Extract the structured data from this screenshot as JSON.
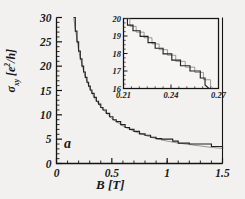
{
  "figure": {
    "panel_label": "a",
    "background_color": "#f2f1ef",
    "line_color": "#222222",
    "secondary_line_color": "#8a8a8a",
    "axis_color": "#141414"
  },
  "main_axes": {
    "xlabel": "B [T]",
    "ylabel_sigma": "σ",
    "ylabel_sub": "xy",
    "ylabel_units_open": " [e",
    "ylabel_sup": "2",
    "ylabel_units_close": "/h]",
    "xticks": [
      "0",
      "0.5",
      "1",
      "1.5"
    ],
    "xtick_values": [
      0,
      0.5,
      1,
      1.5
    ],
    "yticks": [
      "0",
      "5",
      "10",
      "15",
      "20",
      "25",
      "30"
    ],
    "ytick_values": [
      0,
      5,
      10,
      15,
      20,
      25,
      30
    ],
    "xlim": [
      0,
      1.5
    ],
    "ylim": [
      0,
      30
    ]
  },
  "inset_axes": {
    "xticks": [
      "0.21",
      "0.24",
      "0.27"
    ],
    "xtick_values": [
      0.21,
      0.24,
      0.27
    ],
    "yticks": [
      "16",
      "17",
      "18",
      "19",
      "20"
    ],
    "ytick_values": [
      16,
      17,
      18,
      19,
      20
    ],
    "xlim": [
      0.21,
      0.27
    ],
    "ylim": [
      16,
      20
    ]
  },
  "chart_data": {
    "type": "line",
    "title": "",
    "xlabel": "B [T]",
    "ylabel": "σxy [e2/h]",
    "xlim": [
      0,
      1.5
    ],
    "ylim": [
      0,
      30
    ],
    "grid": false,
    "legend": "none",
    "annotations": [
      {
        "text": "a",
        "x": 0.1,
        "y": 3.5
      }
    ],
    "series": [
      {
        "name": "sigma_xy quantized staircase",
        "color": "#222222",
        "comment": "quantum Hall conductivity: plateaus at integer filling, envelope ~ 4.6/B",
        "x": [
          0.155,
          0.17,
          0.185,
          0.2,
          0.215,
          0.23,
          0.245,
          0.26,
          0.275,
          0.29,
          0.305,
          0.32,
          0.34,
          0.36,
          0.38,
          0.4,
          0.42,
          0.45,
          0.48,
          0.51,
          0.54,
          0.58,
          0.62,
          0.66,
          0.7,
          0.75,
          0.8,
          0.85,
          0.9,
          0.95,
          1.0,
          1.05,
          1.1,
          1.2,
          1.3,
          1.4,
          1.5
        ],
        "y": [
          30.0,
          27.2,
          25.0,
          23.1,
          21.5,
          20.0,
          18.8,
          17.7,
          16.7,
          15.9,
          15.1,
          14.4,
          13.6,
          12.8,
          12.2,
          11.5,
          11.0,
          10.3,
          9.6,
          9.0,
          8.6,
          8.0,
          7.4,
          7.0,
          6.6,
          6.1,
          5.8,
          5.4,
          5.1,
          5.0,
          5.0,
          4.6,
          4.2,
          4.0,
          4.0,
          3.5,
          3.0
        ]
      },
      {
        "name": "reference 1/B trace",
        "color": "#8a8a8a",
        "comment": "smooth classical 1/B background overlaid on the staircase",
        "x": [
          0.155,
          0.2,
          0.25,
          0.3,
          0.35,
          0.4,
          0.5,
          0.6,
          0.7,
          0.8,
          0.9,
          1.0,
          1.1,
          1.2,
          1.3,
          1.4,
          1.5
        ],
        "y": [
          30.0,
          23.2,
          18.5,
          15.4,
          13.2,
          11.6,
          9.2,
          7.7,
          6.6,
          5.8,
          5.1,
          4.6,
          4.2,
          3.9,
          3.6,
          3.3,
          3.1
        ]
      }
    ],
    "inset": {
      "type": "line",
      "xlabel": "",
      "ylabel": "",
      "xlim": [
        0.21,
        0.27
      ],
      "ylim": [
        16,
        20
      ],
      "grid": false,
      "series": [
        {
          "name": "sigma_xy staircase (zoom)",
          "color": "#222222",
          "x": [
            0.21,
            0.2125,
            0.2125,
            0.216,
            0.216,
            0.2205,
            0.2205,
            0.2255,
            0.2255,
            0.23,
            0.23,
            0.235,
            0.235,
            0.2405,
            0.2405,
            0.246,
            0.246,
            0.252,
            0.252,
            0.2585,
            0.2585,
            0.2615,
            0.2615,
            0.264
          ],
          "y": [
            20.0,
            20.0,
            19.62,
            19.62,
            19.3,
            19.3,
            18.98,
            18.98,
            18.62,
            18.62,
            18.3,
            18.3,
            17.98,
            17.98,
            17.62,
            17.62,
            17.3,
            17.3,
            17.0,
            17.0,
            16.6,
            16.6,
            16.2,
            16.0
          ]
        },
        {
          "name": "reference trace (zoom)",
          "color": "#8a8a8a",
          "x": [
            0.2105,
            0.214,
            0.214,
            0.218,
            0.218,
            0.223,
            0.223,
            0.228,
            0.228,
            0.2325,
            0.2325,
            0.2378,
            0.2378,
            0.243,
            0.243,
            0.249,
            0.249,
            0.255,
            0.255,
            0.2605,
            0.2605,
            0.265,
            0.265,
            0.2665
          ],
          "y": [
            20.0,
            20.0,
            19.55,
            19.55,
            19.22,
            19.22,
            18.9,
            18.9,
            18.55,
            18.55,
            18.22,
            18.22,
            17.9,
            17.9,
            17.55,
            17.55,
            17.22,
            17.22,
            16.92,
            16.92,
            16.5,
            16.5,
            16.15,
            16.0
          ]
        }
      ]
    }
  }
}
